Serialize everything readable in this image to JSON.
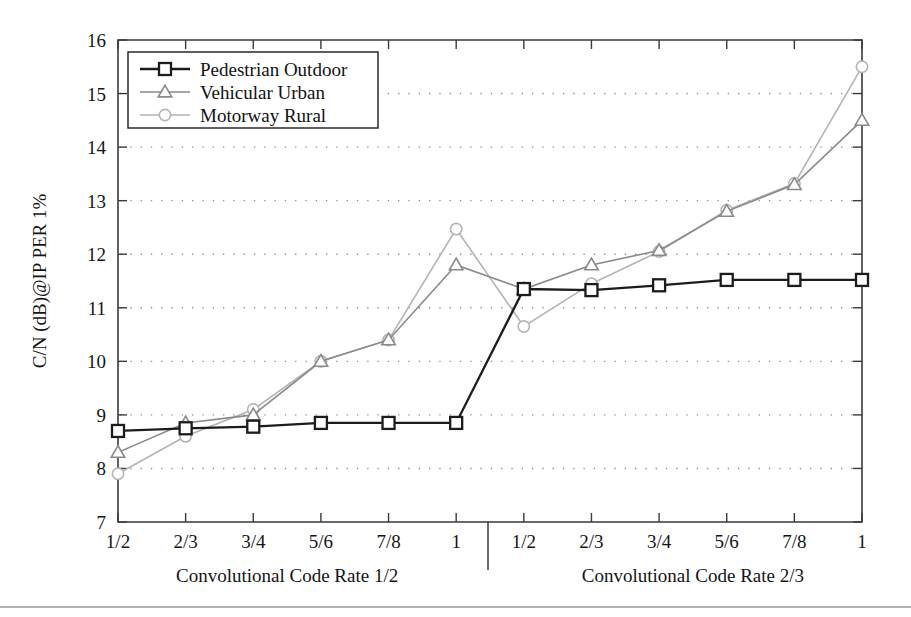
{
  "chart_data": {
    "type": "line",
    "title": "",
    "xlabel": "",
    "ylabel": "C/N (dB)@IP PER 1%",
    "ylim": [
      7,
      16
    ],
    "yticks": [
      7,
      8,
      9,
      10,
      11,
      12,
      13,
      14,
      15,
      16
    ],
    "grid": true,
    "legend_position": "top-left",
    "x_groups": [
      {
        "label": "Convolutional Code Rate 1/2",
        "categories": [
          "1/2",
          "2/3",
          "3/4",
          "5/6",
          "7/8",
          "1"
        ]
      },
      {
        "label": "Convolutional Code Rate 2/3",
        "categories": [
          "1/2",
          "2/3",
          "3/4",
          "5/6",
          "7/8",
          "1"
        ]
      }
    ],
    "categories": [
      "1/2",
      "2/3",
      "3/4",
      "5/6",
      "7/8",
      "1",
      "1/2",
      "2/3",
      "3/4",
      "5/6",
      "7/8",
      "1"
    ],
    "series": [
      {
        "name": "Pedestrian Outdoor",
        "marker": "square",
        "color": "#1c1c1c",
        "values": [
          8.7,
          8.75,
          8.78,
          8.85,
          8.85,
          8.85,
          11.35,
          11.33,
          11.42,
          11.52,
          11.52,
          11.52
        ]
      },
      {
        "name": "Vehicular Urban",
        "marker": "triangle",
        "color": "#8a8a8a",
        "values": [
          8.3,
          8.85,
          9.0,
          10.0,
          10.4,
          11.8,
          11.35,
          11.8,
          12.07,
          12.8,
          13.3,
          14.5
        ]
      },
      {
        "name": "Motorway Rural",
        "marker": "circle",
        "color": "#b4b4b4",
        "values": [
          7.9,
          8.6,
          9.1,
          10.0,
          10.4,
          12.47,
          10.65,
          11.45,
          12.05,
          12.82,
          13.32,
          15.5
        ]
      }
    ]
  },
  "legend": {
    "entries": [
      {
        "label": "Pedestrian Outdoor"
      },
      {
        "label": "Vehicular Urban"
      },
      {
        "label": "Motorway Rural"
      }
    ]
  },
  "colors": {
    "pedestrian": "#1c1c1c",
    "vehicular": "#8a8a8a",
    "motorway": "#b4b4b4",
    "axis": "#3a3a3a",
    "grid": "#8d8d8d"
  }
}
